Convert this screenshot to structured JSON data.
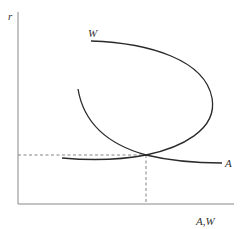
{
  "diagram": {
    "type": "economics-curve-diagram",
    "axes": {
      "y_label": "r",
      "x_label": "A,W"
    },
    "curves": [
      {
        "id": "W",
        "label": "W",
        "shape": "backward-bending loop"
      },
      {
        "id": "A",
        "label": "A",
        "shape": "downward-sloping, convex"
      }
    ],
    "equilibrium": {
      "marker": "dashed guide lines from intersection to both axes"
    },
    "colors": {
      "curve": "#2a2a2a",
      "axis": "#888888",
      "guide": "#777777",
      "label": "#333333"
    }
  }
}
